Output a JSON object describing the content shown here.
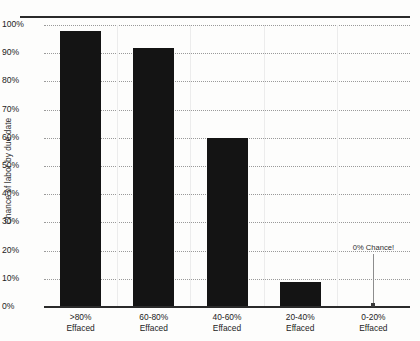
{
  "chart_data": {
    "type": "bar",
    "title": "",
    "xlabel": "",
    "ylabel": "Chance of labor by due date",
    "ylim": [
      0,
      100
    ],
    "grid": true,
    "legend_position": "none",
    "categories": [
      ">80%\nEffaced",
      "60-80%\nEffaced",
      "40-60%\nEffaced",
      "20-40%\nEffaced",
      "0-20%\nEffaced"
    ],
    "category_lines": [
      {
        "line1": ">80%",
        "line2": "Effaced"
      },
      {
        "line1": "60-80%",
        "line2": "Effaced"
      },
      {
        "line1": "40-60%",
        "line2": "Effaced"
      },
      {
        "line1": "20-40%",
        "line2": "Effaced"
      },
      {
        "line1": "0-20%",
        "line2": "Effaced"
      }
    ],
    "values": [
      98,
      92,
      60,
      9,
      0
    ],
    "y_tick_labels": [
      "100%",
      "90%",
      "80%",
      "70%",
      "60%",
      "50%",
      "40%",
      "30%",
      "20%",
      "10%",
      "0%"
    ],
    "y_tick_values": [
      100,
      90,
      80,
      70,
      60,
      50,
      40,
      30,
      20,
      10,
      0
    ],
    "annotations": [
      {
        "text": "0% Chance!",
        "category_index": 4,
        "value": 0
      }
    ],
    "bar_color": "#141414",
    "gridline_color": "#9a9a9a",
    "axis_color": "#2b2b2b",
    "annotation_color": "#8d8d8d",
    "background_color": "#fdfdfc"
  }
}
